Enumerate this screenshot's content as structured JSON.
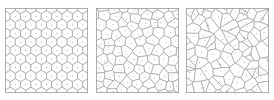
{
  "figure": {
    "panel_count": 3,
    "background_color": "#ffffff",
    "edge_color": "#8e8e8e",
    "frame_color": "#9a9a9a",
    "seed_color": "#555555"
  },
  "panels": [
    {
      "id": "panel-left",
      "name": "regular-lattice-voronoi",
      "label": "",
      "regularity": "regular",
      "jitter": 0.0,
      "seed_count": 88,
      "grid_cols": 8,
      "grid_rows": 11,
      "description": "Nearly regular hexagonal/brick lattice Voronoi tessellation"
    },
    {
      "id": "panel-middle",
      "name": "partially-relaxed-voronoi",
      "label": "",
      "regularity": "intermediate",
      "jitter": 0.35,
      "seed_count": 88,
      "grid_cols": 8,
      "grid_rows": 11,
      "description": "Partially perturbed lattice Voronoi tessellation"
    },
    {
      "id": "panel-right",
      "name": "random-poisson-voronoi",
      "label": "",
      "regularity": "random",
      "jitter": 0.85,
      "seed_count": 88,
      "grid_cols": 8,
      "grid_rows": 11,
      "description": "Poisson-random point Voronoi tessellation"
    }
  ],
  "chart_data": {
    "type": "diagram",
    "subtype": "voronoi",
    "title": "",
    "xlabel": "",
    "ylabel": "",
    "grid": false,
    "legend": null,
    "panel_box": {
      "x": 0,
      "y": 0,
      "width": 83,
      "height": 85
    },
    "series": [
      {
        "name": "regular",
        "jitter": 0.0,
        "points": [
          [
            5.2,
            3.9
          ],
          [
            15.6,
            3.9
          ],
          [
            26.0,
            3.9
          ],
          [
            36.4,
            3.9
          ],
          [
            46.8,
            3.9
          ],
          [
            57.2,
            3.9
          ],
          [
            67.6,
            3.9
          ],
          [
            78.0,
            3.9
          ],
          [
            0.0,
            11.6
          ],
          [
            10.4,
            11.6
          ],
          [
            20.8,
            11.6
          ],
          [
            31.2,
            11.6
          ],
          [
            41.6,
            11.6
          ],
          [
            52.0,
            11.6
          ],
          [
            62.4,
            11.6
          ],
          [
            72.8,
            11.6
          ],
          [
            83.0,
            11.6
          ],
          [
            5.2,
            19.3
          ],
          [
            15.6,
            19.3
          ],
          [
            26.0,
            19.3
          ],
          [
            36.4,
            19.3
          ],
          [
            46.8,
            19.3
          ],
          [
            57.2,
            19.3
          ],
          [
            67.6,
            19.3
          ],
          [
            78.0,
            19.3
          ],
          [
            0.0,
            27.0
          ],
          [
            10.4,
            27.0
          ],
          [
            20.8,
            27.0
          ],
          [
            31.2,
            27.0
          ],
          [
            41.6,
            27.0
          ],
          [
            52.0,
            27.0
          ],
          [
            62.4,
            27.0
          ],
          [
            72.8,
            27.0
          ],
          [
            83.0,
            27.0
          ],
          [
            5.2,
            34.7
          ],
          [
            15.6,
            34.7
          ],
          [
            26.0,
            34.7
          ],
          [
            36.4,
            34.7
          ],
          [
            46.8,
            34.7
          ],
          [
            57.2,
            34.7
          ],
          [
            67.6,
            34.7
          ],
          [
            78.0,
            34.7
          ],
          [
            0.0,
            42.4
          ],
          [
            10.4,
            42.4
          ],
          [
            20.8,
            42.4
          ],
          [
            31.2,
            42.4
          ],
          [
            41.6,
            42.4
          ],
          [
            52.0,
            42.4
          ],
          [
            62.4,
            42.4
          ],
          [
            72.8,
            42.4
          ],
          [
            83.0,
            42.4
          ],
          [
            5.2,
            50.1
          ],
          [
            15.6,
            50.1
          ],
          [
            26.0,
            50.1
          ],
          [
            36.4,
            50.1
          ],
          [
            46.8,
            50.1
          ],
          [
            57.2,
            50.1
          ],
          [
            67.6,
            50.1
          ],
          [
            78.0,
            50.1
          ],
          [
            0.0,
            57.8
          ],
          [
            10.4,
            57.8
          ],
          [
            20.8,
            57.8
          ],
          [
            31.2,
            57.8
          ],
          [
            41.6,
            57.8
          ],
          [
            52.0,
            57.8
          ],
          [
            62.4,
            57.8
          ],
          [
            72.8,
            57.8
          ],
          [
            83.0,
            57.8
          ],
          [
            5.2,
            65.5
          ],
          [
            15.6,
            65.5
          ],
          [
            26.0,
            65.5
          ],
          [
            36.4,
            65.5
          ],
          [
            46.8,
            65.5
          ],
          [
            57.2,
            65.5
          ],
          [
            67.6,
            65.5
          ],
          [
            78.0,
            65.5
          ],
          [
            0.0,
            73.2
          ],
          [
            10.4,
            73.2
          ],
          [
            20.8,
            73.2
          ],
          [
            31.2,
            73.2
          ],
          [
            41.6,
            73.2
          ],
          [
            52.0,
            73.2
          ],
          [
            62.4,
            73.2
          ],
          [
            72.8,
            73.2
          ],
          [
            83.0,
            73.2
          ],
          [
            5.2,
            80.9
          ],
          [
            15.6,
            80.9
          ],
          [
            26.0,
            80.9
          ],
          [
            36.4,
            80.9
          ],
          [
            46.8,
            80.9
          ],
          [
            57.2,
            80.9
          ],
          [
            67.6,
            80.9
          ],
          [
            78.0,
            80.9
          ]
        ]
      },
      {
        "name": "intermediate",
        "jitter": 0.35,
        "points": []
      },
      {
        "name": "random",
        "jitter": 0.85,
        "points": []
      }
    ]
  }
}
